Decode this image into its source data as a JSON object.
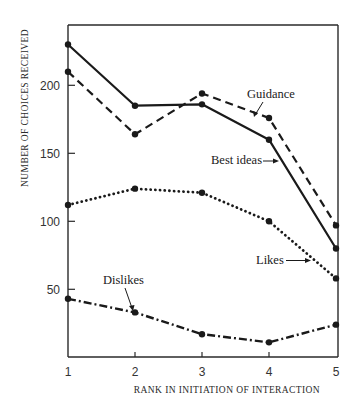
{
  "chart_data": {
    "type": "line",
    "title": "",
    "xlabel": "RANK IN INITIATION OF INTERACTION",
    "ylabel": "NUMBER OF CHOICES RECEIVED",
    "x": [
      1,
      2,
      3,
      4,
      5
    ],
    "x_ticks": [
      "1",
      "2",
      "3",
      "4",
      "5"
    ],
    "y_ticks": [
      50,
      100,
      150,
      200
    ],
    "ylim": [
      0,
      250
    ],
    "xlim": [
      1,
      5
    ],
    "grid": false,
    "legend": "inline annotations with arrows",
    "series": [
      {
        "name": "Best ideas",
        "style": "solid",
        "values": [
          230,
          185,
          186,
          160,
          80
        ]
      },
      {
        "name": "Guidance",
        "style": "dashed",
        "values": [
          210,
          164,
          194,
          176,
          97
        ]
      },
      {
        "name": "Likes",
        "style": "dotted",
        "values": [
          112,
          124,
          121,
          100,
          58
        ]
      },
      {
        "name": "Dislikes",
        "style": "dash-dot",
        "values": [
          43,
          33,
          17,
          11,
          24
        ]
      }
    ]
  },
  "labels": {
    "ylabel": "NUMBER OF CHOICES RECEIVED",
    "xlabel": "RANK IN INITIATION OF INTERACTION",
    "y_ticks": [
      "50",
      "100",
      "150",
      "200"
    ],
    "x_ticks": [
      "1",
      "2",
      "3",
      "4",
      "5"
    ],
    "annotations": {
      "guidance": "Guidance",
      "best_ideas": "Best ideas",
      "likes": "Likes",
      "dislikes": "Dislikes"
    }
  },
  "colors": {
    "ink": "#1a1a1a",
    "background": "#ffffff"
  }
}
